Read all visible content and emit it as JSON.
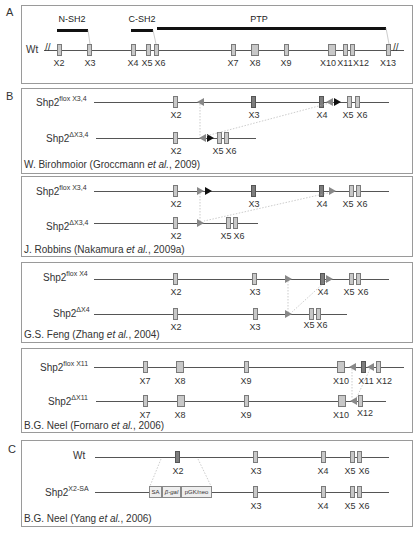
{
  "panels": {
    "A": {
      "letter": "A",
      "wt_label": "Wt",
      "domains": [
        {
          "label": "N-SH2",
          "x1": 57,
          "x2": 88
        },
        {
          "label": "C-SH2",
          "x1": 131,
          "x2": 153
        },
        {
          "label": "PTP",
          "x1": 157,
          "x2": 386
        }
      ],
      "exons": [
        {
          "label": "X2",
          "x": 59
        },
        {
          "label": "X3",
          "x": 89
        },
        {
          "label": "X4",
          "x": 133
        },
        {
          "label": "X5",
          "x": 148
        },
        {
          "label": "X6",
          "x": 156
        },
        {
          "label": "X7",
          "x": 233
        },
        {
          "label": "X8",
          "x": 255
        },
        {
          "label": "X9",
          "x": 286
        },
        {
          "label": "X10",
          "x": 332
        },
        {
          "label": "X11",
          "x": 345
        },
        {
          "label": "X12",
          "x": 352
        },
        {
          "label": "X13",
          "x": 388
        }
      ]
    },
    "B": {
      "letter": "B",
      "models": [
        {
          "flox_base": "Shp2",
          "flox_sup": "flox X3,4",
          "del_base": "Shp2",
          "del_sup": "ΔX3,4",
          "credit_pre": "W. Birohmoior (Groccmann ",
          "credit_etal": "et al.",
          "credit_post": ", 2009)",
          "flox_exons": [
            "X2",
            "X3",
            "X4",
            "X5",
            "X6"
          ],
          "del_exons": [
            "X2",
            "X5",
            "X6"
          ]
        },
        {
          "flox_base": "Shp2",
          "flox_sup": "flox X3,4",
          "del_base": "Shp2",
          "del_sup": "ΔX3,4",
          "credit_pre": "J. Robbins (Nakamura ",
          "credit_etal": "et al.",
          "credit_post": ", 2009a)",
          "flox_exons": [
            "X2",
            "X3",
            "X4",
            "X5",
            "X6"
          ],
          "del_exons": [
            "X2",
            "X5",
            "X6"
          ]
        },
        {
          "flox_base": "Shp2",
          "flox_sup": "flox X4",
          "del_base": "Shp2",
          "del_sup": "ΔX4",
          "credit_pre": "G.S. Feng (Zhang ",
          "credit_etal": "et al.",
          "credit_post": ", 2004)",
          "flox_exons": [
            "X2",
            "X3",
            "X4",
            "X5",
            "X6"
          ],
          "del_exons": [
            "X2",
            "X3",
            "X5",
            "X6"
          ]
        },
        {
          "flox_base": "Shp2",
          "flox_sup": "flox X11",
          "del_base": "Shp2",
          "del_sup": "ΔX11",
          "credit_pre": "B.G. Neel (Fornaro ",
          "credit_etal": "et al.",
          "credit_post": ", 2006)",
          "flox_exons": [
            "X7",
            "X8",
            "X9",
            "X10",
            "X11",
            "X12"
          ],
          "del_exons": [
            "X7",
            "X8",
            "X9",
            "X10",
            "X12"
          ]
        }
      ]
    },
    "C": {
      "letter": "C",
      "wt_label": "Wt",
      "mut_base": "Shp2",
      "mut_sup": "X2-SA",
      "cassette": [
        "SA",
        "β-gal",
        "pGK/neo"
      ],
      "wt_exons": [
        "X2",
        "X3",
        "X4",
        "X5",
        "X6"
      ],
      "mut_exons": [
        "X3",
        "X4",
        "X5",
        "X6"
      ],
      "credit_pre": "B.G. Neel (Yang ",
      "credit_etal": "et al.",
      "credit_post": ", 2006)"
    }
  }
}
